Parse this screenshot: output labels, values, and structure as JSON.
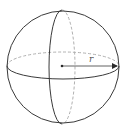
{
  "diagram": {
    "radius_label": "r",
    "colors": {
      "outline": "#3a3a3a",
      "hidden_edge": "#b0b0b0",
      "label": "#555555",
      "background": "#ffffff"
    },
    "elements": [
      "outer-circle",
      "equator-front-solid",
      "equator-back-dashed",
      "meridian-front-solid",
      "meridian-back-dashed",
      "center-point",
      "radius-arrow",
      "radius-label"
    ]
  }
}
